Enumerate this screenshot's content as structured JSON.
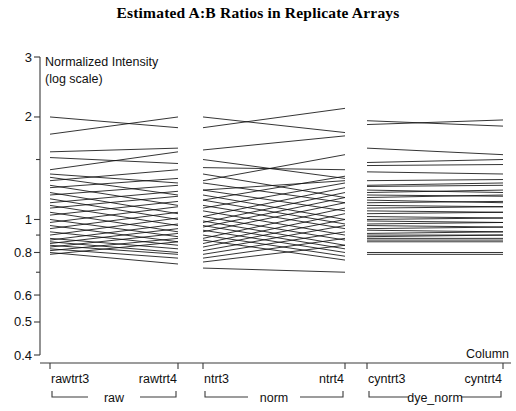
{
  "chart": {
    "title": "Estimated A:B Ratios in Replicate Arrays",
    "axis_caption_line1": "Normalized Intensity",
    "axis_caption_line2": "(log scale)",
    "column_label": "Column"
  },
  "chart_data": {
    "type": "line",
    "title": "Estimated A:B Ratios in Replicate Arrays",
    "subtitle": "",
    "xlabel": "Column",
    "ylabel": "Normalized Intensity (log scale)",
    "yscale": "log",
    "ylim": [
      0.4,
      3
    ],
    "grid": false,
    "legend": "none",
    "ytick_labels": [
      "3",
      "2",
      "1",
      "0.8",
      "0.6",
      "0.5",
      "0.4"
    ],
    "ytick_values": [
      3,
      2,
      1,
      0.8,
      0.6,
      0.5,
      0.4
    ],
    "yminor_ticks": [
      1.5,
      0.9,
      0.7
    ],
    "categories": [
      "rawtrt3",
      "rawtrt4",
      "ntrt3",
      "ntrt4",
      "cyntrt3",
      "cyntrt4"
    ],
    "groups": [
      {
        "label": "raw",
        "categories": [
          "rawtrt3",
          "rawtrt4"
        ]
      },
      {
        "label": "norm",
        "categories": [
          "ntrt3",
          "ntrt4"
        ]
      },
      {
        "label": "dye_norm",
        "categories": [
          "cyntrt3",
          "cyntrt4"
        ]
      }
    ],
    "series": [
      {
        "name": "g01",
        "values": [
          2.0,
          1.86,
          1.86,
          2.12,
          1.95,
          1.88
        ]
      },
      {
        "name": "g02",
        "values": [
          1.78,
          2.0,
          2.0,
          1.8,
          1.9,
          1.96
        ]
      },
      {
        "name": "g03",
        "values": [
          1.58,
          1.62,
          1.6,
          1.76,
          1.62,
          1.55
        ]
      },
      {
        "name": "g04",
        "values": [
          1.52,
          1.46,
          1.42,
          1.4,
          1.47,
          1.5
        ]
      },
      {
        "name": "g05",
        "values": [
          1.4,
          1.58,
          1.5,
          1.32,
          1.44,
          1.45
        ]
      },
      {
        "name": "g06",
        "values": [
          1.36,
          1.28,
          1.3,
          1.55,
          1.38,
          1.36
        ]
      },
      {
        "name": "g07",
        "values": [
          1.33,
          1.18,
          1.22,
          1.3,
          1.26,
          1.28
        ]
      },
      {
        "name": "g08",
        "values": [
          1.3,
          1.4,
          1.36,
          1.16,
          1.3,
          1.31
        ]
      },
      {
        "name": "g09",
        "values": [
          1.26,
          1.1,
          1.14,
          1.34,
          1.22,
          1.2
        ]
      },
      {
        "name": "g10",
        "values": [
          1.24,
          1.32,
          1.28,
          1.12,
          1.25,
          1.26
        ]
      },
      {
        "name": "g11",
        "values": [
          1.2,
          1.04,
          1.08,
          1.28,
          1.18,
          1.17
        ]
      },
      {
        "name": "g12",
        "values": [
          1.18,
          1.26,
          1.22,
          1.06,
          1.2,
          1.22
        ]
      },
      {
        "name": "g13",
        "values": [
          1.15,
          1.0,
          1.02,
          1.24,
          1.14,
          1.12
        ]
      },
      {
        "name": "g14",
        "values": [
          1.12,
          1.21,
          1.18,
          1.0,
          1.16,
          1.18
        ]
      },
      {
        "name": "g15",
        "values": [
          1.1,
          0.96,
          0.98,
          1.2,
          1.1,
          1.09
        ]
      },
      {
        "name": "g16",
        "values": [
          1.08,
          1.17,
          1.14,
          0.97,
          1.12,
          1.13
        ]
      },
      {
        "name": "g17",
        "values": [
          1.05,
          0.92,
          0.95,
          1.16,
          1.06,
          1.05
        ]
      },
      {
        "name": "g18",
        "values": [
          1.03,
          1.13,
          1.1,
          0.94,
          1.08,
          1.09
        ]
      },
      {
        "name": "g19",
        "values": [
          1.0,
          0.89,
          0.92,
          1.12,
          1.02,
          1.01
        ]
      },
      {
        "name": "g20",
        "values": [
          0.98,
          1.09,
          1.06,
          0.9,
          1.04,
          1.05
        ]
      },
      {
        "name": "g21",
        "values": [
          0.96,
          0.86,
          0.88,
          1.08,
          0.99,
          0.98
        ]
      },
      {
        "name": "g22",
        "values": [
          0.94,
          1.05,
          1.02,
          0.87,
          1.0,
          1.01
        ]
      },
      {
        "name": "g23",
        "values": [
          0.92,
          0.84,
          0.85,
          1.04,
          0.96,
          0.95
        ]
      },
      {
        "name": "g24",
        "values": [
          0.9,
          1.01,
          0.99,
          0.84,
          0.97,
          0.98
        ]
      },
      {
        "name": "g25",
        "values": [
          0.88,
          0.82,
          0.83,
          1.0,
          0.93,
          0.92
        ]
      },
      {
        "name": "g26",
        "values": [
          0.87,
          0.97,
          0.96,
          0.82,
          0.94,
          0.95
        ]
      },
      {
        "name": "g27",
        "values": [
          0.86,
          0.8,
          0.81,
          0.96,
          0.9,
          0.9
        ]
      },
      {
        "name": "g28",
        "values": [
          0.85,
          0.94,
          0.93,
          0.8,
          0.91,
          0.92
        ]
      },
      {
        "name": "g29",
        "values": [
          0.84,
          0.79,
          0.79,
          0.92,
          0.88,
          0.88
        ]
      },
      {
        "name": "g30",
        "values": [
          0.83,
          0.91,
          0.9,
          0.78,
          0.89,
          0.9
        ]
      },
      {
        "name": "g31",
        "values": [
          0.82,
          0.77,
          0.77,
          0.88,
          0.86,
          0.86
        ]
      },
      {
        "name": "g32",
        "values": [
          0.81,
          0.88,
          0.87,
          0.76,
          0.87,
          0.87
        ]
      },
      {
        "name": "g33",
        "values": [
          0.8,
          0.74,
          0.75,
          0.84,
          0.8,
          0.8
        ]
      },
      {
        "name": "g34",
        "values": [
          0.79,
          0.86,
          0.72,
          0.7,
          0.79,
          0.79
        ]
      }
    ]
  }
}
